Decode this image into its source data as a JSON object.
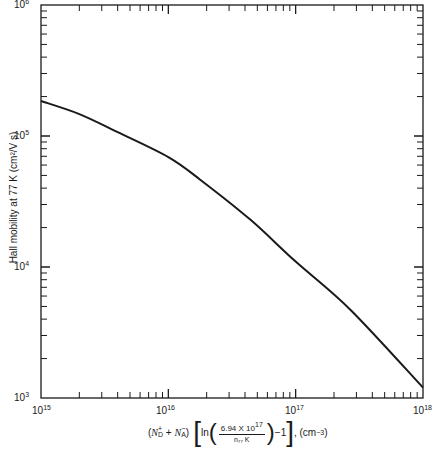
{
  "chart_data": {
    "type": "line",
    "title": "",
    "xlabel": "(N_D^+ + N_A^-) [ln(6.94 X 10^17 / n_77 K) - 1], (cm^-3)",
    "ylabel": "Hall mobility at 77 K (cm^2/V s)",
    "xscale": "log",
    "yscale": "log",
    "xlim": [
      1000000000000000.0,
      1e+18
    ],
    "ylim": [
      1000.0,
      1000000.0
    ],
    "x_tick_labels": [
      "10^15",
      "10^16",
      "10^17",
      "10^18"
    ],
    "y_tick_labels": [
      "10^3",
      "10^4",
      "10^5",
      "10^6"
    ],
    "grid": false,
    "legend": null,
    "series": [
      {
        "name": "Hall mobility",
        "x": [
          1000000000000000.0,
          2000000000000000.0,
          4000000000000000.0,
          1e+16,
          1.8e+16,
          4.4e+16,
          1e+17,
          2.7e+17,
          1e+18
        ],
        "y": [
          185000,
          147000,
          107000,
          69000,
          46000,
          23000,
          11000,
          4700,
          1200
        ]
      }
    ]
  },
  "labels": {
    "y_title": "Hall mobility at 77 K (cm²/V s)",
    "y_ticks": [
      {
        "base": "10",
        "exp": "6"
      },
      {
        "base": "10",
        "exp": "5"
      },
      {
        "base": "10",
        "exp": "4"
      },
      {
        "base": "10",
        "exp": "3"
      }
    ],
    "x_ticks": [
      {
        "base": "10",
        "exp": "15"
      },
      {
        "base": "10",
        "exp": "16"
      },
      {
        "base": "10",
        "exp": "17"
      },
      {
        "base": "10",
        "exp": "18"
      }
    ],
    "x_title": {
      "open": "(",
      "nd": "N",
      "nd_sub": "D",
      "nd_sup": "+",
      "plus": " + ",
      "na": "N",
      "na_sub": "A",
      "na_sup": "−",
      "close": ")",
      "ln": "ln",
      "num": "6.94 X 10",
      "num_exp": "17",
      "den": "n₇₇ K",
      "minus_one": "−1",
      "units": ", (cm",
      "units_exp": "−3",
      "units_close": ")"
    }
  }
}
